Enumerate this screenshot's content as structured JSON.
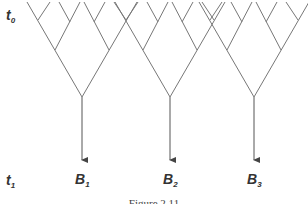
{
  "diagram": {
    "type": "branching-trees",
    "time_labels": {
      "top": {
        "base": "t",
        "sub": "0"
      },
      "bottom": {
        "base": "t",
        "sub": "1"
      }
    },
    "outcomes": [
      {
        "base": "B",
        "sub": "1"
      },
      {
        "base": "B",
        "sub": "2"
      },
      {
        "base": "B",
        "sub": "3"
      }
    ],
    "caption": "Figure 2.11",
    "colors": {
      "line": "#777777",
      "arrow": "#555555",
      "text": "#333333"
    }
  }
}
